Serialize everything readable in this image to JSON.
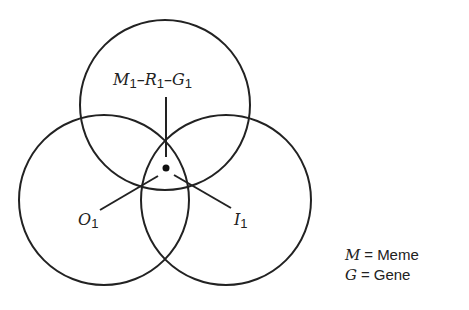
{
  "diagram": {
    "circles": [
      {
        "id": "top",
        "cx": 165,
        "cy": 105,
        "r": 85
      },
      {
        "id": "left",
        "cx": 104,
        "cy": 200,
        "r": 85
      },
      {
        "id": "right",
        "cx": 226,
        "cy": 200,
        "r": 85
      }
    ],
    "center_dot": {
      "cx": 166,
      "cy": 168,
      "r": 3.5
    },
    "stroke_color": "#222222",
    "labels": {
      "top": {
        "parts": [
          "M",
          "1",
          "–R",
          "1",
          "–G",
          "1"
        ]
      },
      "left": {
        "letter": "O",
        "sub": "1"
      },
      "right": {
        "letter": "I",
        "sub": "1"
      }
    },
    "legend": [
      {
        "symbol": "M",
        "eq": "=",
        "text": "Meme"
      },
      {
        "symbol": "G",
        "eq": "=",
        "text": "Gene"
      }
    ]
  }
}
